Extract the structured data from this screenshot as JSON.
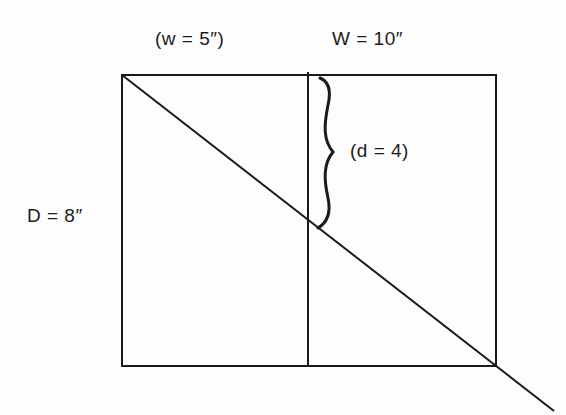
{
  "page_header_fragment": "...g                 y           g   p",
  "diagram": {
    "labels": {
      "small_width": "(w = 5″)",
      "large_width": "W = 10″",
      "small_depth": "(d = 4)",
      "large_depth": "D = 8″"
    },
    "shapes": {
      "outer_rectangle": {
        "x1": 122,
        "y1": 75,
        "x2": 496,
        "y2": 366
      },
      "divider_x": 308,
      "diagonal": {
        "x1": 122,
        "y1": 75,
        "x2": 554,
        "y2": 411
      },
      "brace": {
        "x": 318,
        "y_top": 77,
        "y_bottom": 228,
        "tip_x": 332
      }
    },
    "colors": {
      "line": "#1a1a1a",
      "background": "#fdfdfd"
    }
  }
}
